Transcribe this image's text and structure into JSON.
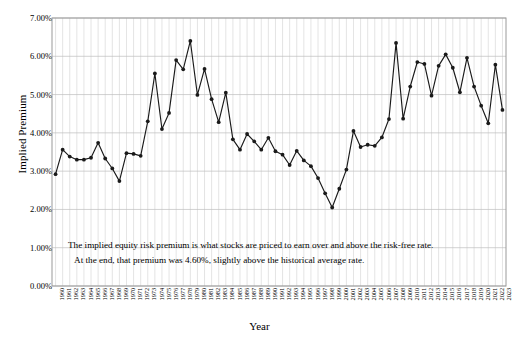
{
  "chart_data": {
    "type": "line",
    "title": "",
    "xlabel": "Year",
    "ylabel": "Implied Premium",
    "ylim": [
      0,
      7
    ],
    "ytick_labels": [
      "0.00%",
      "1.00%",
      "2.00%",
      "3.00%",
      "4.00%",
      "5.00%",
      "6.00%",
      "7.00%"
    ],
    "ytick_values": [
      0,
      1,
      2,
      3,
      4,
      5,
      6,
      7
    ],
    "grid": true,
    "legend": "none",
    "series_color": "#1a1a1a",
    "categories": [
      "1960",
      "1961",
      "1962",
      "1963",
      "1964",
      "1965",
      "1966",
      "1967",
      "1968",
      "1969",
      "1970",
      "1971",
      "1972",
      "1973",
      "1974",
      "1975",
      "1976",
      "1977",
      "1978",
      "1979",
      "1980",
      "1981",
      "1982",
      "1983",
      "1984",
      "1985",
      "1986",
      "1987",
      "1988",
      "1989",
      "1990",
      "1991",
      "1992",
      "1993",
      "1994",
      "1995",
      "1996",
      "1997",
      "1998",
      "1999",
      "2000",
      "2001",
      "2002",
      "2003",
      "2004",
      "2005",
      "2006",
      "2007",
      "2008",
      "2009",
      "2010",
      "2011",
      "2012",
      "2013",
      "2014",
      "2015",
      "2016",
      "2017",
      "2018",
      "2019",
      "2020",
      "2021",
      "2022",
      "2023"
    ],
    "values": [
      2.92,
      3.56,
      3.38,
      3.3,
      3.3,
      3.35,
      3.74,
      3.33,
      3.07,
      2.74,
      3.47,
      3.45,
      3.4,
      4.3,
      5.55,
      4.1,
      4.52,
      5.9,
      5.66,
      6.4,
      4.99,
      5.67,
      4.88,
      4.28,
      5.05,
      3.83,
      3.56,
      3.97,
      3.78,
      3.56,
      3.87,
      3.52,
      3.43,
      3.16,
      3.53,
      3.28,
      3.13,
      2.82,
      2.42,
      2.05,
      2.54,
      3.04,
      4.05,
      3.63,
      3.69,
      3.66,
      3.88,
      4.36,
      6.35,
      4.37,
      5.21,
      5.85,
      5.8,
      4.97,
      5.75,
      6.05,
      5.7,
      5.06,
      5.96,
      5.21,
      4.71,
      4.25,
      5.78,
      4.6
    ]
  },
  "annotation": {
    "line1": "The implied equity risk premium is what stocks are priced to earn over and above the risk-free rate.",
    "line2": "At the end, that premium was 4.60%, slightly above the historical average rate."
  }
}
